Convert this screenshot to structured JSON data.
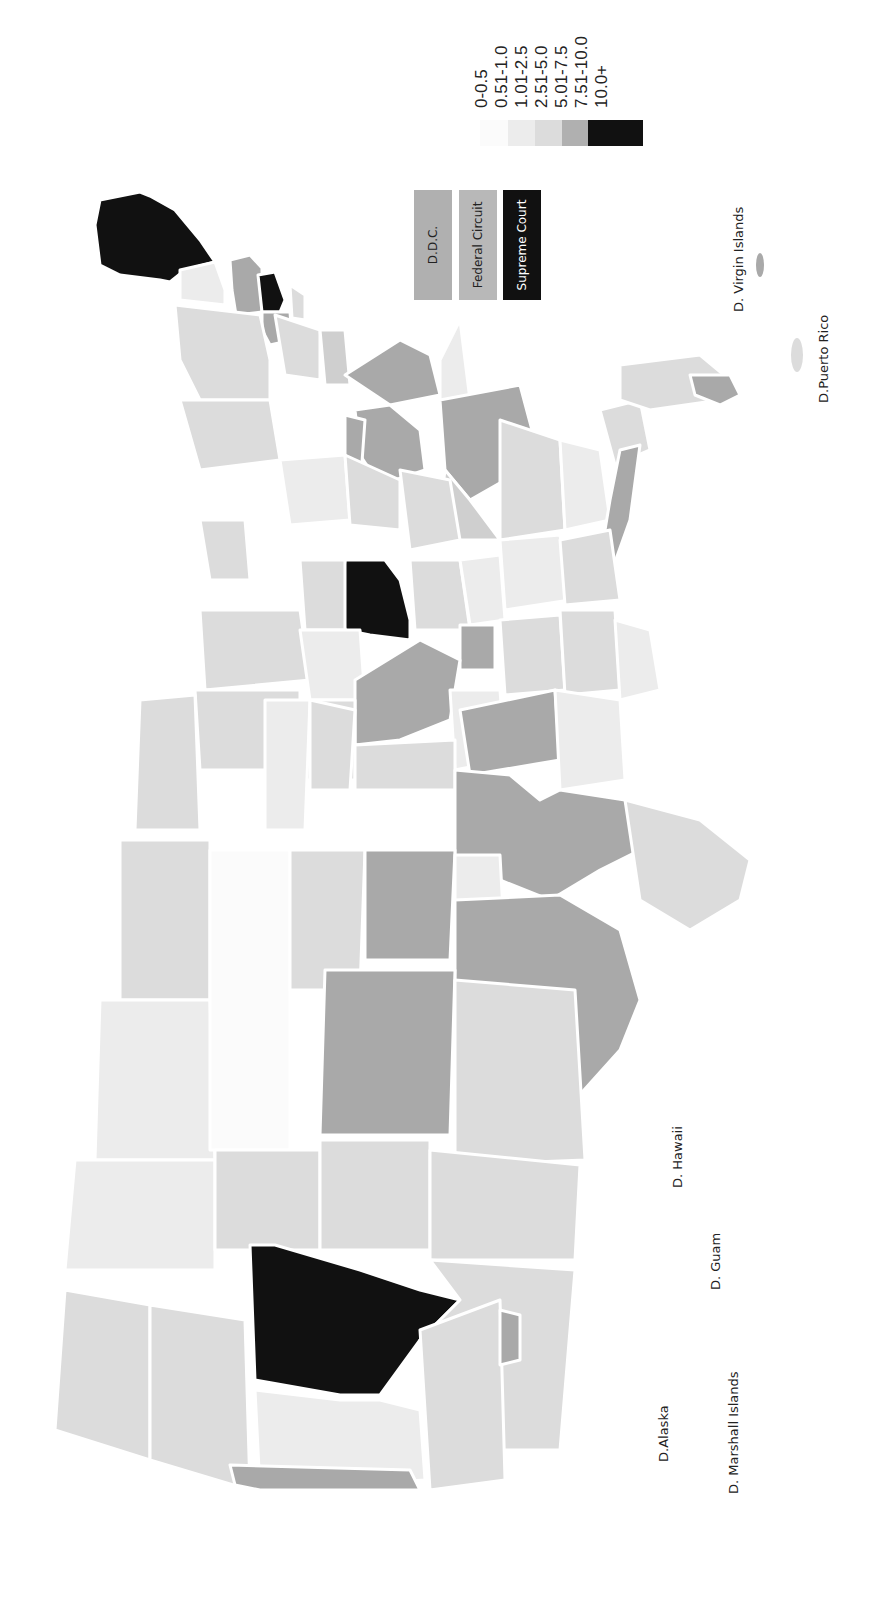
{
  "orientation": "rotated-90-ccw",
  "legend": {
    "title": "",
    "items": [
      {
        "label": "0-0.5",
        "color": "#fbfbfb"
      },
      {
        "label": "0.51-1.0",
        "color": "#ececec"
      },
      {
        "label": "1.01-2.5",
        "color": "#dcdcdc"
      },
      {
        "label": "2.51-5.0",
        "color": "#cfcfcf"
      },
      {
        "label": "5.01-7.5",
        "color": "#a9a9a9"
      },
      {
        "label": "7.51-10.0",
        "color": "#111111"
      },
      {
        "label": "10.0+",
        "color": "#111111"
      }
    ]
  },
  "special_courts": [
    {
      "label": "D.D.C.",
      "color": "#b0b0b0",
      "text_color": "#222222"
    },
    {
      "label": "Federal Circuit",
      "color": "#b8b8b8",
      "text_color": "#222222"
    },
    {
      "label": "Supreme Court",
      "color": "#111111",
      "text_color": "#ffffff"
    }
  ],
  "territory_labels": {
    "alaska": "D.Alaska",
    "marshall": "D. Marshall Islands",
    "guam": "D. Guam",
    "hawaii": "D. Hawaii",
    "puerto_rico": "D.Puerto Rico",
    "virgin_islands": "D. Virgin Islands"
  },
  "colors": {
    "c0": "#fbfbfb",
    "c1": "#ececec",
    "c2": "#dcdcdc",
    "c3": "#cfcfcf",
    "c4": "#a9a9a9",
    "c5": "#111111"
  }
}
